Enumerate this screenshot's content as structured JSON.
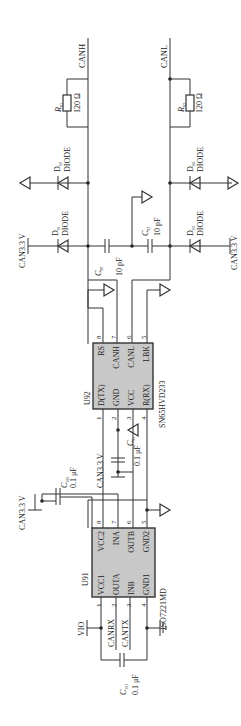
{
  "schematic": {
    "nets": {
      "canh": "CANH",
      "canl": "CANL",
      "can33_a": "CAN3.3 V",
      "can33_b": "CAN3.3 V",
      "can33_c": "CAN3.3 V",
      "can33_d": "CAN3.3 V",
      "vio": "VIO",
      "canrx": "CANRX",
      "cantx": "CANTX"
    },
    "resistors": [
      {
        "ref": "R",
        "sub": "91",
        "value": "120 Ω"
      },
      {
        "ref": "R",
        "sub": "92",
        "value": "120 Ω"
      }
    ],
    "diodes": [
      {
        "ref": "D",
        "sub": "92",
        "value": "DIODE"
      },
      {
        "ref": "D",
        "sub": "91",
        "value": "DIODE"
      },
      {
        "ref": "D",
        "sub": "94",
        "value": "DIODE"
      },
      {
        "ref": "D",
        "sub": "93",
        "value": "DIODE"
      }
    ],
    "capacitors": [
      {
        "ref": "C",
        "sub": "99",
        "value": "10 pF"
      },
      {
        "ref": "C",
        "sub": "92",
        "value": "10 pF"
      },
      {
        "ref": "C",
        "sub": "91",
        "value": "0.1 μF"
      },
      {
        "ref": "C",
        "sub": "100",
        "value": "0.1 μF"
      },
      {
        "ref": "C",
        "sub": "101",
        "value": "0.1 μF"
      }
    ],
    "u92": {
      "ref": "U92",
      "part": "SN65HVD233",
      "pins_left": [
        "D(TX)",
        "GND",
        "VCC",
        "R(RX)"
      ],
      "pins_right": [
        "RS",
        "CANH",
        "CANL",
        "LBK"
      ],
      "pin_nums_bottom": [
        "1",
        "2",
        "3",
        "4"
      ],
      "pin_nums_top": [
        "8",
        "7",
        "6",
        "5"
      ]
    },
    "u91": {
      "ref": "U91",
      "part": "ISO7221MD",
      "pins_left": [
        "VCC1",
        "OUTA",
        "INB",
        "GND1"
      ],
      "pins_right": [
        "VCC2",
        "INA",
        "OUTB",
        "GND2"
      ],
      "pin_nums_bottom": [
        "1",
        "2",
        "3",
        "4"
      ],
      "pin_nums_top": [
        "8",
        "7",
        "6",
        "5"
      ]
    }
  }
}
